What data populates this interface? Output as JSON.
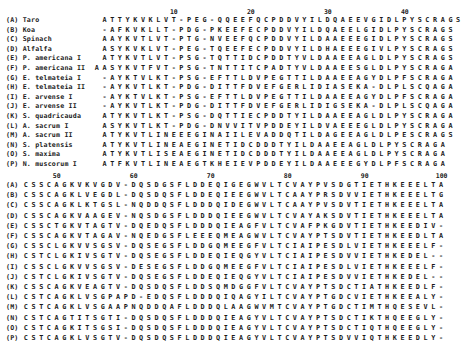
{
  "top_block": {
    "ticks": [
      {
        "label": "10",
        "col": 10
      },
      {
        "label": "20",
        "col": 20
      },
      {
        "label": "30",
        "col": 30
      },
      {
        "label": "40",
        "col": 40
      }
    ],
    "rows": [
      {
        "label": "(A) Taro",
        "seq": " ATTYKVKLVT-PEG-QQEEFQCPDDVYILDQAEEVGIDLPYSCRAGS"
      },
      {
        "label": "(B) Koa",
        "seq": " -AFKVKLLT-PDG-PKEEFECPDDVYILDQAEELGIDLPYSCRAGS"
      },
      {
        "label": "(C) Spinach",
        "seq": " AAYKVTLVT-PTG-NVEEFQCPDDVYILDAAEEEGIDLPYSCRAGS"
      },
      {
        "label": "(D) Alfalfa",
        "seq": " ASYKVKLVT-PEG-TQEEFECPDDVYILDHAEEEGIVLPYSCRAGS"
      },
      {
        "label": "(E) P. americana I",
        "seq": " ATYKVTLVT-PSG-TQTTIDCPDDTYVLDAAEEAGLDLPYSCRAGS"
      },
      {
        "label": "(F) P. americana II",
        "seq": "AASYKVTFVT-PSG-TNTTITCPADTYVLDAAEESGLDLPYSCRAGA"
      },
      {
        "label": "(G) E. telmateia I",
        "seq": " -AYKTVLKT-PSG-EFTTLDVPEGTTILDAAEEAGYDLPFSCRAGA"
      },
      {
        "label": "(H) E. telmateia II",
        "seq": " -AYKVTLKT-PDG-DITTFDVEFGERLIDIASEKA-DLPLSCQAGA"
      },
      {
        "label": "(I) E. arvense I",
        "seq": " -AYKTVLKT-PSG-EFTTLDVPEGTTILDAAEEAGYDLPFSCRAGA"
      },
      {
        "label": "(J) E. arvense II",
        "seq": " -AYKVTLKT-PDG-DITTFDVEFGERLIDIGSEKA-DLPLSCQAGA"
      },
      {
        "label": "(K) S. quadricauda",
        "seq": " ATYKVTLKT-PSG-DQTTIECPDDTYILDAAEEAGLDLPYSCRAGA"
      },
      {
        "label": "(L) A. sacrum I",
        "seq": " ASYKVTLKT-PDG-DNVVITVPDDEYILDVAEEEGLDLPYSCRAGA"
      },
      {
        "label": "(M) A. sacrum II",
        "seq": " ATYKVTLINEEEGINAIILEVADDQTILDAGEEAGLDLPESCRAGS"
      },
      {
        "label": "(N) S. platensis",
        "seq": " ATYKVTLINEAEGINETIDCDDDTYILDAAEEAGLDLPYSCRAGA"
      },
      {
        "label": "(O) S. maxima",
        "seq": " ATYKVTLISEAEGINETIDCDDDTYILDAAEEAGLDLPYSCRAGA"
      },
      {
        "label": "(P) N. muscorum I",
        "seq": " ATFKVTLINEAEGTKHEIEVPDDEYILDAAEEEGYDLPFSCRAGA"
      }
    ]
  },
  "bottom_block": {
    "ticks": [
      {
        "label": "50",
        "col": 5
      },
      {
        "label": "60",
        "col": 15
      },
      {
        "label": "70",
        "col": 25
      },
      {
        "label": "80",
        "col": 35
      },
      {
        "label": "90",
        "col": 45
      },
      {
        "label": "100",
        "col": 55
      }
    ],
    "rows": [
      {
        "label": "(A)",
        "seq": "CSSCAGKVKVGDV-DQSDGSFLDDEQIGEGWVLTCVAYPVSDGTIETHKEEELTA"
      },
      {
        "label": "(B)",
        "seq": "CSSCAGKLVEGDL-DQSDQSFLDDEQIEEGWVLTCAAYPRSDVVIETHKEEELTG"
      },
      {
        "label": "(C)",
        "seq": "CSSCAGKLKTGSL-NQDDQSFLDDDQIDEGWVLTCAAYPVSDVTIETHKEEELTA"
      },
      {
        "label": "(D)",
        "seq": "CSSCAGKVAAGEV-NQSDGSFLDDDQIEEGWVLTCVAYAKSDVTIETHKEEELTA"
      },
      {
        "label": "(E)",
        "seq": "CSSCTGKVTAGTV-DQEDQSFLDDDQIEAGFVLTCVAFPKGDVTIETHKEEDIV-"
      },
      {
        "label": "(F)",
        "seq": "CSSCAGKVTAGAV-NQEDGSFLEEEQMEAGWVLTCVAYPTSDVTIETHKEEDLTA"
      },
      {
        "label": "(G)",
        "seq": "CSSCLGKVVSGSV-DQSEGSFLDDGQMEEGFVLTCIAIPESDLVIETHKEEELF-"
      },
      {
        "label": "(H)",
        "seq": "CSTCLGKIVSGTV-DQSEGSFLDDEQIEQGYVLTCIAIPESDVVIETHKEDEL--"
      },
      {
        "label": "(I)",
        "seq": "CSSCLGKVVSGSV-DESEGSFLDDGQMEEGFVLTCIAIPESDLVIETHKEEELF-"
      },
      {
        "label": "(J)",
        "seq": "CSTCLGKIVSGTV-DQSEGSFLDDEQIEQGYVLTCIAIPESDVVIETHKEDEL--"
      },
      {
        "label": "(K)",
        "seq": "CSSCAGKVEAGTV-DQSDQSFLDDSQMDGGFVLTCVAYPTSDCTIATHKEEDLF-"
      },
      {
        "label": "(L)",
        "seq": "CSTCAGKLVSGPAPD-EDQSFLDDDQIQAGYILTCVAYPTGDCVIETHKEEALY-"
      },
      {
        "label": "(M)",
        "seq": "CSTCAGKLVSGAAPNQDDQAFLDDDQLAAGWVMTCVAYPTGDCTIMTHQESEVL-"
      },
      {
        "label": "(N)",
        "seq": "CSTCAGTITSGTI-DQSDQSFLDDDQIEAGYVLTCVAYPTSDCTIKTHQEEGLY-"
      },
      {
        "label": "(O)",
        "seq": "CSTCAGKITSGSI-DQSDQSFLDDDQIEAGYVLTCVAYPTSDCTIQTHQEEGLY-"
      },
      {
        "label": "(P)",
        "seq": "CSTCAGKLVSGTV-DQSDQSFLDDDQIEAGYVLTCVAYPTSDVVIQTHKEEDLY-"
      }
    ]
  }
}
